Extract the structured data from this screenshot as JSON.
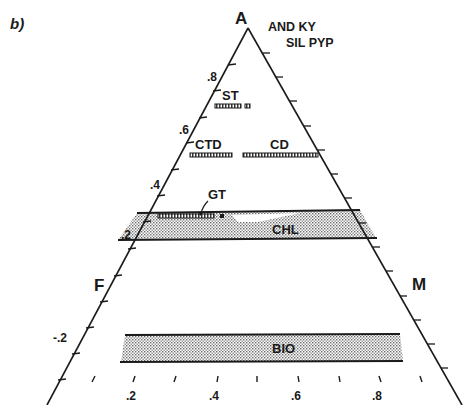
{
  "figure": {
    "panel_label": "b)",
    "vertices": {
      "top": "A",
      "left": "F",
      "right": "M"
    },
    "apex_annotation": {
      "line1": "AND KY",
      "line2": "SIL PYP"
    },
    "left_axis_ticks": [
      ".8",
      ".6",
      ".4",
      ".2",
      "-.2"
    ],
    "bottom_axis_ticks": [
      ".2",
      ".4",
      ".6",
      ".8"
    ],
    "phases": {
      "st": "ST",
      "ctd": "CTD",
      "cd": "CD",
      "gt": "GT",
      "chl": "CHL",
      "bio": "BIO"
    },
    "colors": {
      "ink": "#1a1a1a",
      "stipple": "#c8c8c8",
      "background": "#ffffff"
    }
  }
}
